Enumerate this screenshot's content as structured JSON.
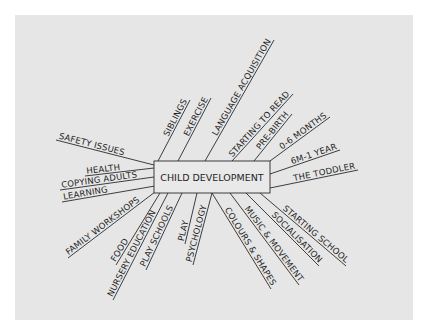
{
  "diagram": {
    "type": "mind-map",
    "center": {
      "label": "CHILD DEVELOPMENT",
      "box": {
        "x": 154,
        "y": 161,
        "w": 116,
        "h": 32
      }
    },
    "colors": {
      "panel": "#e6e6e6",
      "box_fill": "#e9e9e9",
      "line": "#2a2a2a",
      "text": "#1e1e1e"
    },
    "branches": [
      {
        "id": "safety-issues",
        "label": "SAFETY ISSUES",
        "x1": 154,
        "y1": 165,
        "x2": 56,
        "y2": 140,
        "side": "left"
      },
      {
        "id": "health",
        "label": "HEALTH",
        "x1": 154,
        "y1": 168,
        "x2": 85,
        "y2": 176,
        "side": "left"
      },
      {
        "id": "copying-adults",
        "label": "COPYING ADULTS",
        "x1": 154,
        "y1": 177,
        "x2": 60,
        "y2": 190,
        "side": "left"
      },
      {
        "id": "learning",
        "label": "LEARNING",
        "x1": 155,
        "y1": 186,
        "x2": 62,
        "y2": 202,
        "side": "left"
      },
      {
        "id": "siblings",
        "label": "SIBLINGS",
        "x1": 158,
        "y1": 161,
        "x2": 190,
        "y2": 100,
        "side": "top"
      },
      {
        "id": "exercise",
        "label": "EXERCISE",
        "x1": 178,
        "y1": 161,
        "x2": 211,
        "y2": 98,
        "side": "top"
      },
      {
        "id": "language-acquisition",
        "label": "LANGUAGE ACQUISITION",
        "x1": 205,
        "y1": 161,
        "x2": 274,
        "y2": 40,
        "side": "top"
      },
      {
        "id": "starting-to-read",
        "label": "STARTING TO READ",
        "x1": 232,
        "y1": 161,
        "x2": 293,
        "y2": 94,
        "side": "top"
      },
      {
        "id": "pre-birth",
        "label": "PRE-BIRTH",
        "x1": 254,
        "y1": 161,
        "x2": 292,
        "y2": 114,
        "side": "top"
      },
      {
        "id": "0-6-months",
        "label": "0-6 MONTHS",
        "x1": 270,
        "y1": 161,
        "x2": 330,
        "y2": 117,
        "side": "right"
      },
      {
        "id": "6m-1-year",
        "label": "6M-1 YEAR",
        "x1": 270,
        "y1": 174,
        "x2": 340,
        "y2": 150,
        "side": "right"
      },
      {
        "id": "the-toddler",
        "label": "THE TODDLER",
        "x1": 270,
        "y1": 188,
        "x2": 358,
        "y2": 170,
        "side": "right"
      },
      {
        "id": "starting-school",
        "label": "STARTING SCHOOL",
        "x1": 260,
        "y1": 193,
        "x2": 346,
        "y2": 266,
        "side": "bottom-right"
      },
      {
        "id": "socialisation",
        "label": "SOCIALISATION",
        "x1": 246,
        "y1": 193,
        "x2": 319,
        "y2": 266,
        "side": "bottom-right"
      },
      {
        "id": "music-movement",
        "label": "MUSIC & MOVEMENT",
        "x1": 230,
        "y1": 193,
        "x2": 299,
        "y2": 285,
        "side": "bottom-right"
      },
      {
        "id": "colours-shapes",
        "label": "COLOURS & SHAPES",
        "x1": 212,
        "y1": 193,
        "x2": 271,
        "y2": 289,
        "side": "bottom-right"
      },
      {
        "id": "psychology",
        "label": "PSYCHOLOGY",
        "x1": 212,
        "y1": 193,
        "x2": 193,
        "y2": 265,
        "side": "bottom"
      },
      {
        "id": "play",
        "label": "PLAY",
        "x1": 197,
        "y1": 193,
        "x2": 185,
        "y2": 244,
        "side": "bottom"
      },
      {
        "id": "play-schools",
        "label": "PLAY SCHOOLS",
        "x1": 182,
        "y1": 193,
        "x2": 146,
        "y2": 270,
        "side": "bottom"
      },
      {
        "id": "nursery-education",
        "label": "NURSERY EDUCATION",
        "x1": 168,
        "y1": 193,
        "x2": 113,
        "y2": 300,
        "side": "bottom"
      },
      {
        "id": "food",
        "label": "FOOD",
        "x1": 160,
        "y1": 193,
        "x2": 116,
        "y2": 265,
        "side": "bottom"
      },
      {
        "id": "family-workshops",
        "label": "FAMILY WORKSHOPS",
        "x1": 155,
        "y1": 192,
        "x2": 68,
        "y2": 258,
        "side": "bottom-left"
      }
    ]
  }
}
